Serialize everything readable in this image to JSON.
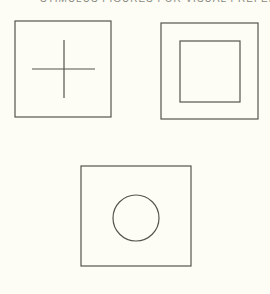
{
  "caption": {
    "text": "STIMULUS FIGURES FOR VISUAL PREFERENCE",
    "clipped": true
  },
  "colors": {
    "background": "#fdfdf5",
    "stroke": "#55554f"
  },
  "figures": [
    {
      "name": "square-with-cross",
      "outer_box": {
        "x": 15,
        "y": 21,
        "w": 96,
        "h": 96
      },
      "cross": {
        "h_x1": 32,
        "h_x2": 95,
        "h_y": 69,
        "v_x": 64,
        "v_y1": 40,
        "v_y2": 98
      }
    },
    {
      "name": "square-with-inner-square",
      "outer_box": {
        "x": 161,
        "y": 23,
        "w": 97,
        "h": 96
      },
      "inner_box": {
        "x": 180,
        "y": 41,
        "w": 60,
        "h": 61
      }
    },
    {
      "name": "square-with-circle",
      "outer_box": {
        "x": 81,
        "y": 166,
        "w": 110,
        "h": 100
      },
      "circle": {
        "cx": 136,
        "cy": 218,
        "r": 23
      }
    }
  ]
}
